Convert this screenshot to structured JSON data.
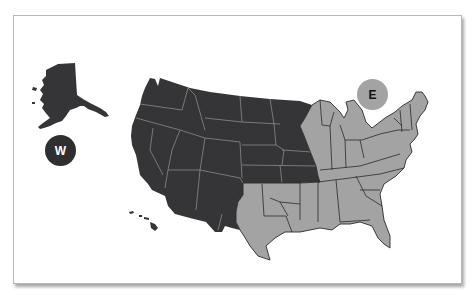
{
  "map": {
    "title": "US regions map",
    "regions": [
      {
        "id": "west",
        "label": "W",
        "color": "#353537",
        "border": "#8a8a8a"
      },
      {
        "id": "east",
        "label": "E",
        "color": "#a3a3a3",
        "border": "#2a2a2a"
      }
    ]
  },
  "badges": {
    "west": "W",
    "east": "E"
  },
  "colors": {
    "west_fill": "#353537",
    "east_fill": "#a3a3a3",
    "card_bg": "#ffffff"
  }
}
